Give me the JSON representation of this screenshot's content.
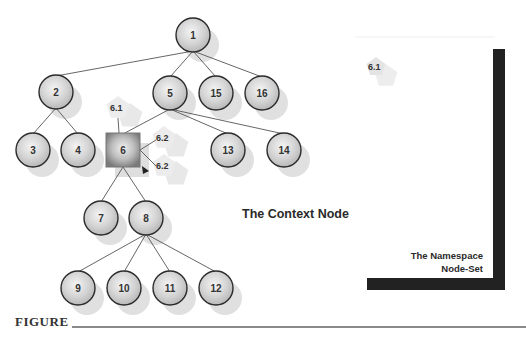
{
  "diagram": {
    "nodes": [
      {
        "id": "1",
        "label": "1",
        "shape": "circle",
        "x": 193,
        "y": 35
      },
      {
        "id": "2",
        "label": "2",
        "shape": "circle",
        "x": 56,
        "y": 92
      },
      {
        "id": "5",
        "label": "5",
        "shape": "circle",
        "x": 170,
        "y": 93
      },
      {
        "id": "15",
        "label": "15",
        "shape": "circle",
        "x": 216,
        "y": 93
      },
      {
        "id": "16",
        "label": "16",
        "shape": "circle",
        "x": 262,
        "y": 93
      },
      {
        "id": "3",
        "label": "3",
        "shape": "circle",
        "x": 33,
        "y": 150
      },
      {
        "id": "4",
        "label": "4",
        "shape": "circle",
        "x": 78,
        "y": 150
      },
      {
        "id": "6",
        "label": "6",
        "shape": "square",
        "x": 123,
        "y": 150
      },
      {
        "id": "13",
        "label": "13",
        "shape": "circle",
        "x": 228,
        "y": 150
      },
      {
        "id": "14",
        "label": "14",
        "shape": "circle",
        "x": 284,
        "y": 150
      },
      {
        "id": "7",
        "label": "7",
        "shape": "circle",
        "x": 101,
        "y": 218
      },
      {
        "id": "8",
        "label": "8",
        "shape": "circle",
        "x": 146,
        "y": 218
      },
      {
        "id": "9",
        "label": "9",
        "shape": "circle",
        "x": 78,
        "y": 288
      },
      {
        "id": "10",
        "label": "10",
        "shape": "circle",
        "x": 124,
        "y": 288
      },
      {
        "id": "11",
        "label": "11",
        "shape": "circle",
        "x": 170,
        "y": 288
      },
      {
        "id": "12",
        "label": "12",
        "shape": "circle",
        "x": 216,
        "y": 288
      }
    ],
    "edges": [
      [
        "1",
        "2"
      ],
      [
        "1",
        "5"
      ],
      [
        "1",
        "15"
      ],
      [
        "1",
        "16"
      ],
      [
        "2",
        "3"
      ],
      [
        "2",
        "4"
      ],
      [
        "5",
        "6"
      ],
      [
        "5",
        "13"
      ],
      [
        "5",
        "14"
      ],
      [
        "6",
        "7"
      ],
      [
        "6",
        "8"
      ],
      [
        "8",
        "9"
      ],
      [
        "8",
        "10"
      ],
      [
        "8",
        "11"
      ],
      [
        "8",
        "12"
      ]
    ],
    "namespace_nodes": [
      {
        "label": "6.1",
        "x": 118,
        "y": 108
      },
      {
        "label": "6.2",
        "x": 164,
        "y": 138
      },
      {
        "label": "6.2",
        "x": 164,
        "y": 166
      }
    ],
    "context_node_label": "The Context Node",
    "namespace_panel": {
      "title_line1": "The Namespace",
      "title_line2": "Node-Set",
      "member_label": "6.1"
    },
    "figure_label": "FIGURE"
  }
}
